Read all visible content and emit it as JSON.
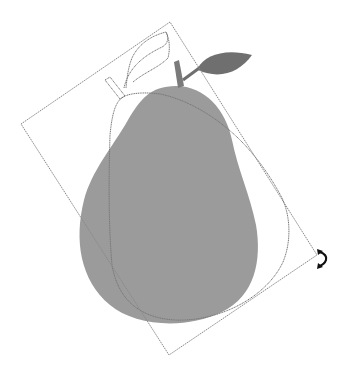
{
  "scene": {
    "description": "Rotate transformation preview of a pear shape",
    "colors": {
      "background": "#ffffff",
      "pear_body": "#9b9b9b",
      "stem": "#7a7a7a",
      "leaf": "#6f6f6f",
      "outline_preview": "#777777",
      "bounding_box": "#8a8a8a",
      "cursor": "#111111"
    },
    "bounding_box": {
      "corners": [
        [
          21,
          124
        ],
        [
          170,
          22
        ],
        [
          317,
          255
        ],
        [
          169,
          355
        ]
      ]
    },
    "cursor": {
      "icon": "rotate-cursor-icon"
    }
  }
}
